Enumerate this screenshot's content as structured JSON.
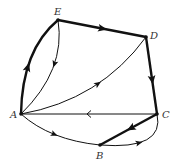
{
  "diagram": {
    "type": "directed-graph",
    "nodes": [
      {
        "id": "A",
        "label": "A"
      },
      {
        "id": "B",
        "label": "B"
      },
      {
        "id": "C",
        "label": "C"
      },
      {
        "id": "D",
        "label": "D"
      },
      {
        "id": "E",
        "label": "E"
      }
    ],
    "edges": [
      {
        "from": "A",
        "to": "E",
        "weight": "thick"
      },
      {
        "from": "E",
        "to": "D",
        "weight": "thick"
      },
      {
        "from": "D",
        "to": "C",
        "weight": "thick"
      },
      {
        "from": "C",
        "to": "B",
        "weight": "thick"
      },
      {
        "from": "E",
        "to": "A",
        "weight": "thin"
      },
      {
        "from": "A",
        "to": "D",
        "weight": "thin"
      },
      {
        "from": "C",
        "to": "A",
        "weight": "thin"
      },
      {
        "from": "A",
        "to": "B",
        "weight": "thin"
      },
      {
        "from": "B",
        "to": "C",
        "weight": "thin"
      }
    ]
  }
}
